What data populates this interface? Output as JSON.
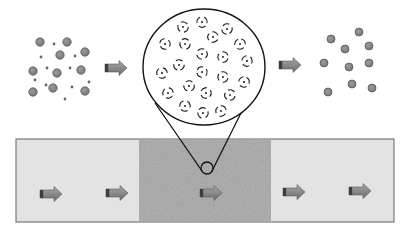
{
  "diagram": {
    "colors": {
      "background": "#ffffff",
      "bar_fill": "#e3e3e3",
      "bar_border": "#7a7a7a",
      "medium_fill": "#a3a3a3",
      "particle_fill": "#8a8a8a",
      "particle_stroke": "#5e5e5e",
      "small_dot": "#666666",
      "arrow_body": "#8c8c8c",
      "arrow_dark": "#3c3c3c",
      "line": "#111111"
    },
    "left_cluster": {
      "large_particles": [
        [
          40,
          42
        ],
        [
          67,
          42
        ],
        [
          60,
          55
        ],
        [
          85,
          52
        ],
        [
          33,
          71
        ],
        [
          57,
          73
        ],
        [
          81,
          70
        ],
        [
          33,
          92
        ],
        [
          53,
          88
        ],
        [
          85,
          91
        ]
      ],
      "small_particles": [
        [
          54,
          44
        ],
        [
          41,
          57
        ],
        [
          75,
          56
        ],
        [
          47,
          68
        ],
        [
          70,
          68
        ],
        [
          35,
          80
        ],
        [
          89,
          82
        ],
        [
          46,
          85
        ],
        [
          72,
          87
        ],
        [
          65,
          99
        ]
      ]
    },
    "right_cluster": {
      "particles": [
        [
          359,
          32
        ],
        [
          331,
          39
        ],
        [
          369,
          46
        ],
        [
          345,
          49
        ],
        [
          324,
          63
        ],
        [
          349,
          67
        ],
        [
          369,
          63
        ],
        [
          352,
          84
        ],
        [
          328,
          92
        ],
        [
          372,
          88
        ]
      ]
    },
    "magnified_view": {
      "center": [
        204,
        67
      ],
      "radius": 60,
      "solvated_ions": [
        [
          183,
          27
        ],
        [
          202,
          22
        ],
        [
          227,
          29
        ],
        [
          213,
          37
        ],
        [
          165,
          44
        ],
        [
          185,
          44
        ],
        [
          240,
          44
        ],
        [
          202,
          54
        ],
        [
          223,
          57
        ],
        [
          247,
          61
        ],
        [
          179,
          65
        ],
        [
          162,
          73
        ],
        [
          202,
          72
        ],
        [
          223,
          77
        ],
        [
          244,
          82
        ],
        [
          189,
          86
        ],
        [
          168,
          93
        ],
        [
          206,
          93
        ],
        [
          230,
          95
        ],
        [
          185,
          106
        ],
        [
          203,
          113
        ],
        [
          221,
          111
        ]
      ],
      "focus_circle": {
        "center": [
          207,
          168
        ],
        "radius": 6
      },
      "cone_left": [
        [
          155,
          103
        ],
        [
          202,
          171
        ]
      ],
      "cone_right": [
        [
          246,
          103
        ],
        [
          212,
          171
        ]
      ]
    },
    "top_arrows": [
      {
        "x": 105,
        "y": 68
      },
      {
        "x": 279,
        "y": 65
      }
    ],
    "channel": {
      "x1": 16,
      "y1": 139,
      "x2": 394,
      "y2": 222,
      "medium": {
        "x1": 139,
        "x2": 271
      }
    },
    "channel_arrows": [
      {
        "x": 40,
        "y": 194
      },
      {
        "x": 106,
        "y": 193
      },
      {
        "x": 200,
        "y": 193
      },
      {
        "x": 283,
        "y": 192
      },
      {
        "x": 349,
        "y": 191
      }
    ]
  }
}
